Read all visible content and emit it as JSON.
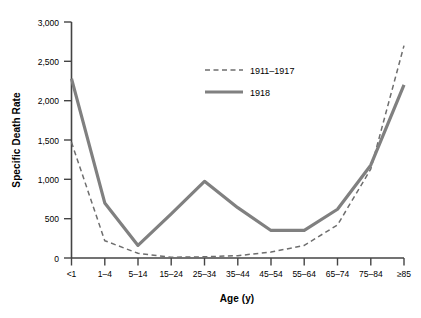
{
  "chart_data": {
    "type": "line",
    "title": "",
    "xlabel": "Age (y)",
    "ylabel": "Specific Death Rate",
    "categories": [
      "<1",
      "1–4",
      "5–14",
      "15–24",
      "25–34",
      "35–44",
      "45–54",
      "55–64",
      "65–74",
      "75–84",
      "≥85"
    ],
    "ylim": [
      0,
      3000
    ],
    "yticks": [
      0,
      500,
      1000,
      1500,
      2000,
      2500,
      3000
    ],
    "ytick_labels": [
      "0",
      "500",
      "1,000",
      "1,500",
      "2,000",
      "2,500",
      "3,000"
    ],
    "grid": false,
    "legend_position": "upper-center",
    "series": [
      {
        "name": "1911–1917",
        "style": "dashed",
        "color": "#6e6e6e",
        "values": [
          1470,
          220,
          60,
          10,
          15,
          30,
          75,
          160,
          420,
          1130,
          2700
        ]
      },
      {
        "name": "1918",
        "style": "solid",
        "color": "#808080",
        "values": [
          2280,
          700,
          160,
          560,
          975,
          640,
          350,
          350,
          620,
          1180,
          2200
        ]
      }
    ]
  },
  "axes": {
    "y_title": "Specific Death Rate",
    "x_title": "Age (y)"
  },
  "legend": {
    "entries": [
      {
        "label": "1911–1917",
        "style": "dashed"
      },
      {
        "label": "1918",
        "style": "solid"
      }
    ]
  }
}
